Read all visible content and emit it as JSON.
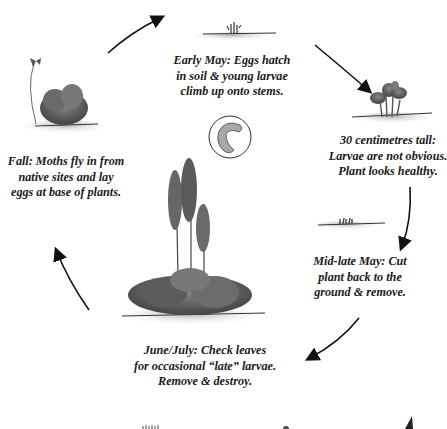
{
  "diagram": {
    "title": "",
    "type": "life-cycle",
    "stages": [
      {
        "id": "early-may",
        "lines": [
          "Early May: Eggs hatch",
          "in soil & young larvae",
          "climb up onto stems."
        ]
      },
      {
        "id": "30cm-tall",
        "lines": [
          "30 centimetres tall:",
          "Larvae are not obvious.",
          "Plant looks healthy."
        ]
      },
      {
        "id": "mid-late-may",
        "lines": [
          "Mid-late May: Cut",
          "plant back to the",
          "ground & remove."
        ]
      },
      {
        "id": "june-july",
        "lines": [
          "June/July: Check leaves",
          "for occasional “late” larvae.",
          "Remove & destroy."
        ]
      },
      {
        "id": "fall",
        "lines": [
          "Fall: Moths fly in from",
          "native sites and lay",
          "eggs at base of plants."
        ]
      }
    ],
    "illustrations": [
      "sprouting-shoots",
      "leafy-plant-30cm",
      "cut-stubble",
      "flowering-delphinium",
      "larva-inset",
      "moth-over-plant"
    ],
    "colors": {
      "ink": "#1a1a1a",
      "foliage": "#555555",
      "ground": "#bdbdbd",
      "larva": "#9a9a9a"
    }
  }
}
